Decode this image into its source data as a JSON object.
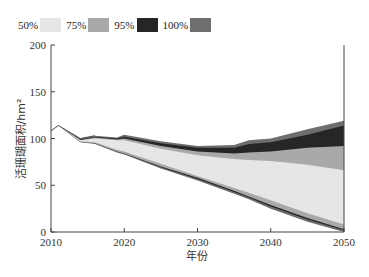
{
  "chart_data": {
    "type": "area",
    "title": "",
    "xlabel": "年份",
    "ylabel": "活珊瑚面积/hm²",
    "xlim": [
      2010,
      2050
    ],
    "ylim": [
      0,
      200
    ],
    "xticks": [
      "2010",
      "2020",
      "2030",
      "2040",
      "2050"
    ],
    "yticks": [
      "0",
      "50",
      "100",
      "150",
      "200"
    ],
    "grid": false,
    "legend_position": "top-left",
    "legend": [
      {
        "label": "50%",
        "color": "#e6e6e6"
      },
      {
        "label": "75%",
        "color": "#a9a9a9"
      },
      {
        "label": "95%",
        "color": "#262626"
      },
      {
        "label": "100%",
        "color": "#6e6e6e"
      }
    ],
    "x": [
      2010,
      2011,
      2014,
      2016,
      2019,
      2020,
      2025,
      2030,
      2035,
      2037,
      2040,
      2045,
      2050
    ],
    "bounds": {
      "upper_100": [
        108,
        114,
        100,
        103,
        101,
        104,
        97,
        92,
        93,
        98,
        100,
        110,
        119
      ],
      "upper_95": [
        108,
        114,
        99,
        102,
        100,
        102,
        95,
        90,
        90,
        94,
        96,
        104,
        114
      ],
      "upper_75": [
        108,
        114,
        98,
        101,
        99,
        100,
        92,
        86,
        84,
        85,
        86,
        90,
        92
      ],
      "upper_50": [
        108,
        114,
        98,
        100,
        98,
        98,
        89,
        82,
        78,
        77,
        76,
        72,
        66
      ],
      "lower_50": [
        108,
        114,
        97,
        96,
        88,
        86,
        73,
        60,
        47,
        42,
        34,
        20,
        8
      ],
      "lower_75": [
        108,
        114,
        96,
        95,
        86,
        84,
        70,
        58,
        44,
        38,
        29,
        15,
        3
      ],
      "lower_100": [
        108,
        114,
        96,
        94,
        85,
        83,
        68,
        55,
        41,
        35,
        25,
        11,
        0
      ]
    }
  }
}
